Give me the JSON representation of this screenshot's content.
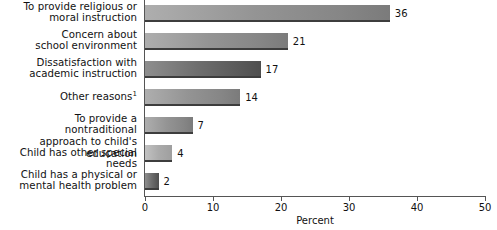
{
  "chart_data": {
    "type": "bar",
    "orientation": "horizontal",
    "title": "",
    "xlabel": "Percent",
    "ylabel": "",
    "xlim": [
      0,
      50
    ],
    "xticks": [
      0,
      10,
      20,
      30,
      40,
      50
    ],
    "grid": false,
    "legend": null,
    "categories": [
      "To provide religious or moral instruction",
      "Concern about school environment",
      "Dissatisfaction with academic instruction",
      "Other reasons",
      "To provide a nontraditional approach to child's education",
      "Child has other special needs",
      "Child has a physical or mental health problem"
    ],
    "values": [
      36,
      21,
      17,
      14,
      7,
      4,
      2
    ],
    "footnote_markers": {
      "3": "1"
    }
  },
  "axis": {
    "title": "Percent",
    "ticks": [
      {
        "value": 0,
        "label": "0"
      },
      {
        "value": 10,
        "label": "10"
      },
      {
        "value": 20,
        "label": "20"
      },
      {
        "value": 30,
        "label": "30"
      },
      {
        "value": 40,
        "label": "40"
      },
      {
        "value": 50,
        "label": "50"
      }
    ]
  },
  "rows": [
    {
      "label_line1": "To provide religious or",
      "label_line2": "moral instruction",
      "superscript": "",
      "value": 36,
      "value_label": "36"
    },
    {
      "label_line1": "Concern about",
      "label_line2": "school environment",
      "superscript": "",
      "value": 21,
      "value_label": "21"
    },
    {
      "label_line1": "Dissatisfaction with",
      "label_line2": "academic instruction",
      "superscript": "",
      "value": 17,
      "value_label": "17"
    },
    {
      "label_line1": "Other reasons",
      "label_line2": "",
      "superscript": "1",
      "value": 14,
      "value_label": "14"
    },
    {
      "label_line1": "To provide a nontraditional",
      "label_line2": "approach to child's education",
      "superscript": "",
      "value": 7,
      "value_label": "7"
    },
    {
      "label_line1": "Child has other special needs",
      "label_line2": "",
      "superscript": "",
      "value": 4,
      "value_label": "4"
    },
    {
      "label_line1": "Child has a physical or",
      "label_line2": "mental health problem",
      "superscript": "",
      "value": 2,
      "value_label": "2"
    }
  ],
  "colors": {
    "background": "#ffffff",
    "axis": "#555555",
    "text": "#111111",
    "bar_light": "#bbbbbb",
    "bar_mid": "#939393",
    "bar_dark": "#5e5e5e",
    "bar_edge": "#3d3d3d"
  }
}
